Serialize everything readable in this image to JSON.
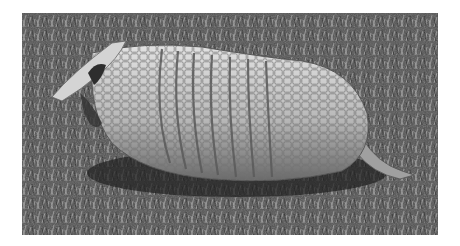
{
  "image": {
    "subject": "armadillo on grass",
    "style": "black-and-white photograph",
    "colors": {
      "background": "#ffffff",
      "grass_dark": "#2e2e2e",
      "grass_mid": "#6a6a6a",
      "grass_light": "#b8b8b8",
      "shell_light": "#d8d8d8",
      "shell_mid": "#a8a8a8",
      "shell_dark": "#5a5a5a"
    }
  }
}
